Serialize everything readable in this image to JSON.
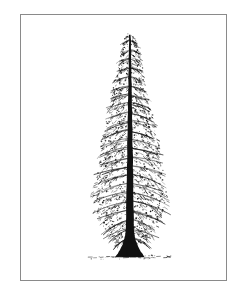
{
  "page": {
    "width": 245,
    "height": 300,
    "background_color": "#ffffff",
    "medium": "line-engraving",
    "has_caption_text": false
  },
  "frame": {
    "name": "plate-border",
    "x": 20,
    "y": 14,
    "width": 207,
    "height": 267,
    "stroke_color": "#8a8a8a",
    "stroke_width": 1,
    "fill_color": "#ffffff"
  },
  "illustration": {
    "subject": "conifer-tree",
    "style": "stippled pen-and-ink botanical engraving",
    "ink_color": "#111111",
    "paper_color": "#ffffff",
    "apex": {
      "x": 130,
      "y": 30
    },
    "base": {
      "x": 130,
      "y": 258
    },
    "widest_span": {
      "left_x": 90,
      "right_x": 166,
      "y": 205
    }
  },
  "tree": {
    "trunk": {
      "name": "trunk",
      "top_y": 34,
      "bottom_y": 258,
      "center_x": 130,
      "top_half_width": 0.8,
      "bottom_half_width": 4.0,
      "flare_start_y": 225,
      "flare_half_width": 15,
      "color": "#111111"
    },
    "crown_profile": [
      {
        "y": 32,
        "half_width": 4
      },
      {
        "y": 44,
        "half_width": 8
      },
      {
        "y": 58,
        "half_width": 11
      },
      {
        "y": 72,
        "half_width": 14
      },
      {
        "y": 86,
        "half_width": 17
      },
      {
        "y": 100,
        "half_width": 20
      },
      {
        "y": 114,
        "half_width": 23
      },
      {
        "y": 128,
        "half_width": 26
      },
      {
        "y": 142,
        "half_width": 29
      },
      {
        "y": 156,
        "half_width": 31
      },
      {
        "y": 170,
        "half_width": 34
      },
      {
        "y": 184,
        "half_width": 36
      },
      {
        "y": 198,
        "half_width": 38
      },
      {
        "y": 210,
        "half_width": 36
      },
      {
        "y": 222,
        "half_width": 31
      },
      {
        "y": 234,
        "half_width": 24
      },
      {
        "y": 244,
        "half_width": 16
      }
    ],
    "branch_whorls": [
      {
        "y": 40,
        "reach": 7,
        "droop": 3
      },
      {
        "y": 49,
        "reach": 9,
        "droop": 3
      },
      {
        "y": 58,
        "reach": 11,
        "droop": 4
      },
      {
        "y": 67,
        "reach": 13,
        "droop": 4
      },
      {
        "y": 76,
        "reach": 15,
        "droop": 5
      },
      {
        "y": 85,
        "reach": 17,
        "droop": 5
      },
      {
        "y": 94,
        "reach": 19,
        "droop": 6
      },
      {
        "y": 103,
        "reach": 21,
        "droop": 6
      },
      {
        "y": 112,
        "reach": 23,
        "droop": 7
      },
      {
        "y": 121,
        "reach": 24,
        "droop": 7
      },
      {
        "y": 130,
        "reach": 26,
        "droop": 8
      },
      {
        "y": 139,
        "reach": 28,
        "droop": 8
      },
      {
        "y": 148,
        "reach": 30,
        "droop": 9
      },
      {
        "y": 157,
        "reach": 31,
        "droop": 9
      },
      {
        "y": 166,
        "reach": 33,
        "droop": 10
      },
      {
        "y": 175,
        "reach": 34,
        "droop": 10
      },
      {
        "y": 184,
        "reach": 36,
        "droop": 11
      },
      {
        "y": 193,
        "reach": 37,
        "droop": 11
      },
      {
        "y": 202,
        "reach": 37,
        "droop": 12
      },
      {
        "y": 211,
        "reach": 35,
        "droop": 12
      },
      {
        "y": 220,
        "reach": 31,
        "droop": 12
      },
      {
        "y": 229,
        "reach": 26,
        "droop": 11
      },
      {
        "y": 238,
        "reach": 20,
        "droop": 10
      }
    ],
    "foliage": {
      "name": "foliage-stipple",
      "cluster_count": 1500,
      "dot_min": 0.5,
      "dot_max": 1.5,
      "color": "#111111"
    }
  },
  "ground": {
    "name": "ground-line",
    "y": 258,
    "left_x": 88,
    "right_x": 172,
    "style": "broken-dashed",
    "color": "#2a2a2a"
  }
}
